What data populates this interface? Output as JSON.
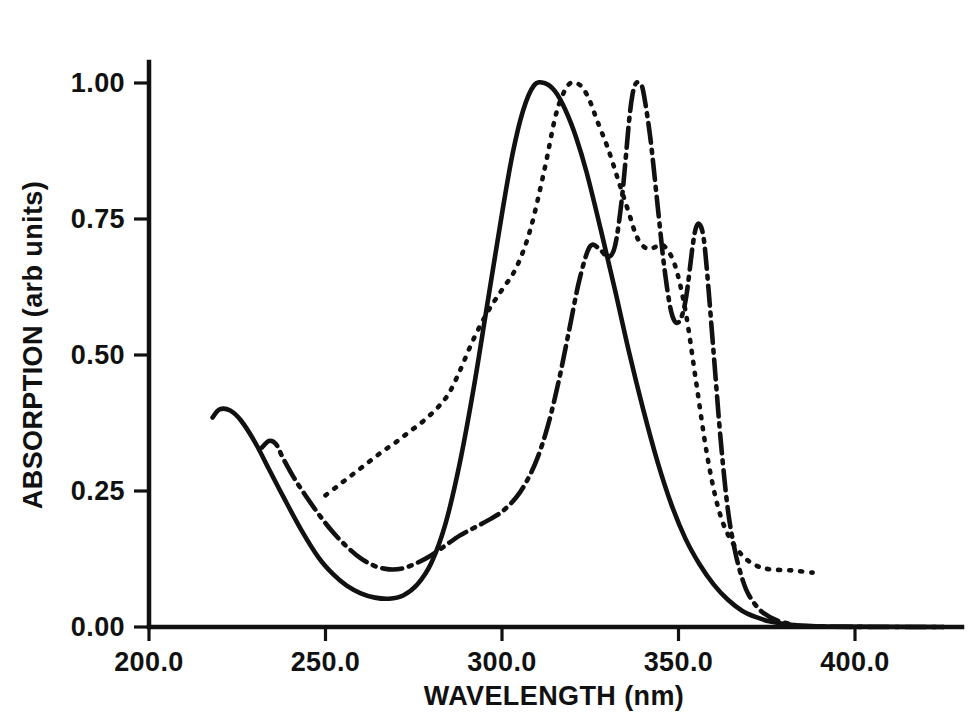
{
  "figure": {
    "background_color": "#ffffff",
    "ink_color": "#111111"
  },
  "chart_data": {
    "type": "line",
    "title": "",
    "subtitle": "",
    "xlabel": "WAVELENGTH (nm)",
    "ylabel": "ABSORPTION (arb units)",
    "xlim": [
      190.0,
      425.0
    ],
    "ylim": [
      0.0,
      1.1
    ],
    "xticks": [
      200.0,
      250.0,
      300.0,
      350.0,
      400.0
    ],
    "xticklabels": [
      "200.0",
      "250.0",
      "300.0",
      "350.0",
      "400.0"
    ],
    "yticks": [
      0.0,
      0.25,
      0.5,
      0.75,
      1.0
    ],
    "yticklabels": [
      "0.00",
      "0.25",
      "0.50",
      "0.75",
      "1.00"
    ],
    "grid": false,
    "legend": "none",
    "annotations": [],
    "series": [
      {
        "name": "solid-curve",
        "style": "solid",
        "dasharray": "none",
        "color": "#111111",
        "x": [
          218.0,
          220.0,
          223.0,
          226.0,
          230.0,
          234.0,
          238.0,
          243.0,
          248.0,
          252.0,
          256.0,
          260.0,
          264.0,
          268.0,
          272.0,
          276.0,
          280.0,
          284.0,
          288.0,
          292.0,
          296.0,
          300.0,
          303.0,
          306.0,
          309.0,
          312.0,
          315.0,
          318.0,
          321.0,
          324.0,
          328.0,
          332.0,
          336.0,
          340.0,
          344.0,
          348.0,
          352.0,
          356.0,
          360.0,
          364.0,
          368.0,
          372.0,
          376.0,
          382.0,
          392.0,
          425.0
        ],
        "y": [
          0.385,
          0.4,
          0.398,
          0.38,
          0.34,
          0.29,
          0.24,
          0.18,
          0.128,
          0.098,
          0.076,
          0.062,
          0.054,
          0.052,
          0.058,
          0.078,
          0.118,
          0.19,
          0.3,
          0.44,
          0.6,
          0.76,
          0.87,
          0.95,
          0.995,
          1.0,
          0.985,
          0.95,
          0.9,
          0.835,
          0.73,
          0.62,
          0.505,
          0.4,
          0.305,
          0.225,
          0.162,
          0.115,
          0.078,
          0.05,
          0.03,
          0.018,
          0.01,
          0.004,
          0.001,
          0.0
        ]
      },
      {
        "name": "dotted-curve",
        "style": "dotted",
        "dasharray": "2,9",
        "color": "#111111",
        "x": [
          250.0,
          254.0,
          258.0,
          262.0,
          266.0,
          270.0,
          274.0,
          278.0,
          282.0,
          285.0,
          288.0,
          292.0,
          296.0,
          300.0,
          304.0,
          308.0,
          312.0,
          315.0,
          317.0,
          319.0,
          321.0,
          323.0,
          325.0,
          327.0,
          330.0,
          333.0,
          336.0,
          338.0,
          340.0,
          342.0,
          344.0,
          346.0,
          349.0,
          352.0,
          355.0,
          358.0,
          361.0,
          364.0,
          368.0,
          372.0,
          376.0,
          382.0,
          388.0
        ],
        "y": [
          0.242,
          0.262,
          0.282,
          0.302,
          0.322,
          0.34,
          0.36,
          0.38,
          0.405,
          0.43,
          0.47,
          0.53,
          0.58,
          0.62,
          0.66,
          0.73,
          0.84,
          0.935,
          0.975,
          0.998,
          1.0,
          0.99,
          0.965,
          0.93,
          0.88,
          0.82,
          0.76,
          0.72,
          0.7,
          0.695,
          0.7,
          0.7,
          0.665,
          0.58,
          0.45,
          0.32,
          0.225,
          0.17,
          0.132,
          0.113,
          0.106,
          0.104,
          0.1
        ]
      },
      {
        "name": "dash-dot-curve",
        "style": "dashdot",
        "dasharray": "20,7,3,7",
        "color": "#111111",
        "x": [
          232.0,
          234.0,
          236.0,
          238.0,
          241.0,
          244.0,
          248.0,
          252.0,
          256.0,
          260.0,
          264.0,
          268.0,
          272.0,
          276.0,
          280.0,
          284.0,
          288.0,
          292.0,
          296.0,
          300.0,
          304.0,
          307.0,
          310.0,
          313.0,
          316.0,
          319.0,
          322.0,
          325.0,
          328.0,
          330.0,
          332.0,
          334.0,
          336.0,
          337.0,
          338.0,
          339.0,
          340.0,
          342.0,
          344.0,
          346.0,
          348.0,
          350.0,
          352.0,
          354.0,
          355.0,
          356.0,
          357.0,
          358.0,
          360.0,
          362.0,
          364.0,
          366.0,
          368.0,
          370.0,
          374.0,
          380.0,
          390.0,
          425.0
        ],
        "y": [
          0.33,
          0.342,
          0.336,
          0.31,
          0.275,
          0.245,
          0.208,
          0.175,
          0.148,
          0.126,
          0.112,
          0.106,
          0.108,
          0.118,
          0.132,
          0.15,
          0.168,
          0.182,
          0.196,
          0.212,
          0.238,
          0.268,
          0.31,
          0.37,
          0.45,
          0.545,
          0.64,
          0.7,
          0.692,
          0.68,
          0.7,
          0.79,
          0.93,
          0.98,
          1.0,
          0.998,
          0.985,
          0.9,
          0.78,
          0.66,
          0.578,
          0.56,
          0.6,
          0.7,
          0.735,
          0.74,
          0.72,
          0.66,
          0.5,
          0.34,
          0.215,
          0.14,
          0.09,
          0.058,
          0.026,
          0.008,
          0.001,
          0.0
        ]
      }
    ]
  }
}
